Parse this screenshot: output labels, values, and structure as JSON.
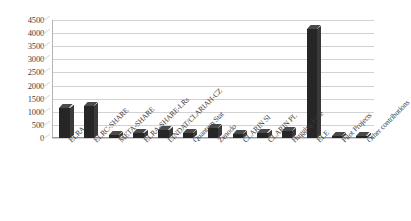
{
  "chart_data": {
    "type": "bar",
    "title": "",
    "xlabel": "",
    "ylabel": "",
    "ylim": [
      0,
      4500
    ],
    "ytick_step": 500,
    "yticks": [
      "4500",
      "4000",
      "3500",
      "3000",
      "2500",
      "2000",
      "1500",
      "1000",
      "500",
      "0"
    ],
    "grid": true,
    "legend": "none",
    "bar_color": "#262626",
    "grid_color": "#d2d2d2",
    "categories": [
      "ELRA",
      "ELRC-SHARE",
      "META-SHARE",
      "ELRA-SHARE-LRs",
      "LINDAT/CLARIAH-CZ",
      "Quantum Stat",
      "Zenodo",
      "CLARIN SI",
      "CLARIN PL",
      "Hugging Face",
      "ELE",
      "Pilot Projects",
      "Other contributions"
    ],
    "values": [
      1150,
      1220,
      100,
      180,
      310,
      200,
      370,
      160,
      200,
      270,
      4150,
      60,
      60
    ]
  }
}
